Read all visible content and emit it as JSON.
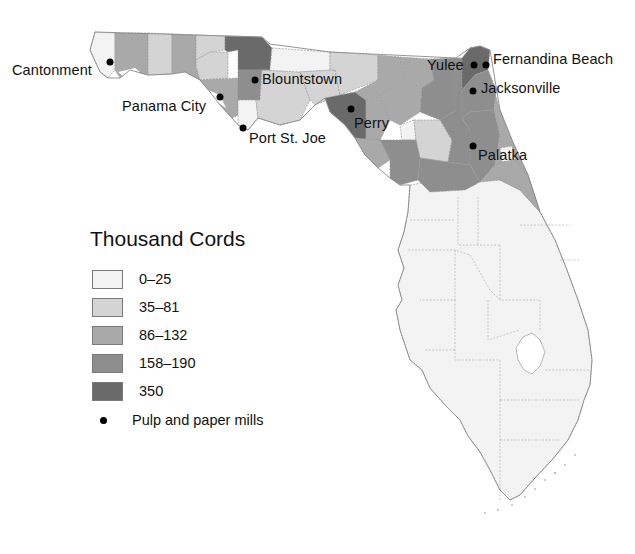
{
  "legend": {
    "title": "Thousand Cords",
    "classes": [
      {
        "label": "0–25",
        "color": "#f3f3f3"
      },
      {
        "label": "35–81",
        "color": "#d4d4d4"
      },
      {
        "label": "86–132",
        "color": "#a9a9a9"
      },
      {
        "label": "158–190",
        "color": "#8e8e8e"
      },
      {
        "label": "350",
        "color": "#6a6a6a"
      }
    ],
    "mill_label": "Pulp and paper mills"
  },
  "cities": [
    {
      "name": "Cantonment",
      "dot": [
        110,
        62
      ],
      "label_pos": [
        12,
        63
      ]
    },
    {
      "name": "Blountstown",
      "dot": [
        255,
        80
      ],
      "label_pos": [
        262,
        72
      ]
    },
    {
      "name": "Panama City",
      "dot": [
        220,
        97
      ],
      "label_pos": [
        122,
        99
      ]
    },
    {
      "name": "Port St. Joe",
      "dot": [
        243,
        128
      ],
      "label_pos": [
        249,
        131
      ]
    },
    {
      "name": "Perry",
      "dot": [
        351,
        109
      ],
      "label_pos": [
        354,
        116
      ]
    },
    {
      "name": "Yulee",
      "dot": [
        474,
        65
      ],
      "label_pos": [
        427,
        58
      ]
    },
    {
      "name": "Fernandina Beach",
      "dot": [
        486,
        65
      ],
      "label_pos": [
        493,
        52
      ]
    },
    {
      "name": "Jacksonville",
      "dot": [
        473,
        91
      ],
      "label_pos": [
        481,
        81
      ]
    },
    {
      "name": "Palatka",
      "dot": [
        473,
        146
      ],
      "label_pos": [
        478,
        148
      ]
    }
  ]
}
